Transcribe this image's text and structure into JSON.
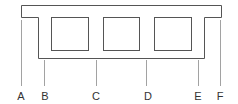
{
  "diagram": {
    "labels": [
      "A",
      "B",
      "C",
      "D",
      "E",
      "F"
    ],
    "void_count": 3,
    "colors": {
      "outline": "#555555",
      "leader": "#8a8a8a",
      "text": "#333333"
    }
  }
}
